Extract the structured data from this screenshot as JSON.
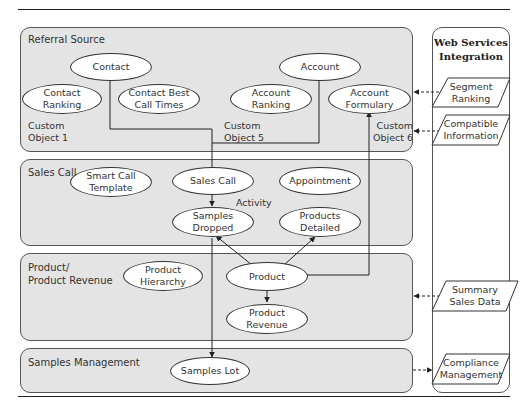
{
  "lanes": {
    "referral_source": {
      "title": "Referral Source",
      "nodes": {
        "contact": "Contact",
        "contact_ranking": "Contact\nRanking",
        "contact_best_call_times": "Contact Best\nCall Times",
        "account": "Account",
        "account_ranking": "Account\nRanking",
        "account_formulary": "Account\nFormulary"
      },
      "labels": {
        "custom_object_1": "Custom\nObject 1",
        "custom_object_5": "Custom\nObject 5",
        "custom_object_6": "Custom\nObject 6"
      }
    },
    "sales_call": {
      "title": "Sales Call",
      "nodes": {
        "smart_call_template": "Smart Call\nTemplate",
        "sales_call": "Sales Call",
        "appointment": "Appointment",
        "samples_dropped": "Samples\nDropped",
        "products_detailed": "Products\nDetailed"
      },
      "labels": {
        "activity": "Activity"
      }
    },
    "product": {
      "title": "Product/\nProduct Revenue",
      "nodes": {
        "product_hierarchy": "Product\nHierarchy",
        "product": "Product",
        "product_revenue": "Product\nRevenue"
      }
    },
    "samples_management": {
      "title": "Samples Management",
      "nodes": {
        "samples_lot": "Samples Lot"
      }
    }
  },
  "web_services": {
    "title": "Web Services\nIntegration",
    "items": {
      "segment_ranking": "Segment\nRanking",
      "compatible_information": "Compatible\nInformation",
      "summary_sales_data": "Summary\nSales Data",
      "compliance_management": "Compliance\nManagement"
    }
  },
  "colors": {
    "panel_fill": "#e4e4e4",
    "stroke": "#333333",
    "node_fill": "#ffffff"
  }
}
